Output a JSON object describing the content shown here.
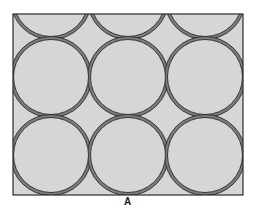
{
  "figure": {
    "label": "A",
    "frame": {
      "x": 13,
      "y": 14,
      "width": 230,
      "height": 181
    },
    "colors": {
      "background": "#ffffff",
      "fill_light": "#d6d6d6",
      "band": "#7c7c7c",
      "outline": "#2a2a2a"
    },
    "large_circle_radius": 37.5,
    "band_radius": 40.5,
    "large_circle_centers": [
      [
        51,
        -1
      ],
      [
        128,
        -1
      ],
      [
        205,
        -1
      ],
      [
        51,
        77
      ],
      [
        128,
        77
      ],
      [
        205,
        77
      ],
      [
        51,
        155
      ],
      [
        128,
        155
      ],
      [
        205,
        155
      ]
    ]
  }
}
